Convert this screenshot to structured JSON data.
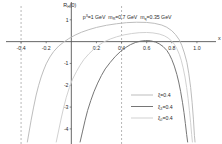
{
  "chart_data": {
    "type": "line",
    "title": "",
    "annotation": "p³=1 GeV   m_R=0.7 GeV   m_q=0.35 GeV",
    "annotation_parts": {
      "p_base": "p",
      "p_sup": "3",
      "p_val": "=1 GeV",
      "mR_base": "m",
      "mR_sub": "R",
      "mR_val": "=0.7 GeV",
      "mq_base": "m",
      "mq_sub": "q",
      "mq_val": "=0.35 GeV"
    },
    "ylabel": "R",
    "ylabel_sub": "H",
    "ylabel_tail": "(0)",
    "xlabel": "x",
    "xlim": [
      -0.52,
      1.12
    ],
    "ylim": [
      -4.6,
      1.45
    ],
    "xticks": [
      -0.4,
      -0.2,
      0.2,
      0.4,
      0.6,
      0.8,
      1.0
    ],
    "xticklabels": [
      "-0.4",
      "-0.2",
      "0.2",
      "0.4",
      "0.6",
      "0.8",
      "1.0"
    ],
    "yticks": [
      1,
      -1,
      -2,
      -3,
      -4
    ],
    "yticklabels": [
      "1",
      "-1",
      "-2",
      "-3",
      "-4"
    ],
    "grid": false,
    "vlines": [
      -0.4,
      0.4
    ],
    "vline_style": "dashed",
    "legend_position": "lower-right",
    "series": [
      {
        "name": "xi",
        "label": "ξ=0.4",
        "color": "#b9b9b9",
        "points": [
          [
            -0.35,
            -4.6
          ],
          [
            -0.32,
            -3.6
          ],
          [
            -0.3,
            -3.0
          ],
          [
            -0.28,
            -2.45
          ],
          [
            -0.26,
            -2.0
          ],
          [
            -0.24,
            -1.62
          ],
          [
            -0.22,
            -1.3
          ],
          [
            -0.2,
            -1.02
          ],
          [
            -0.17,
            -0.7
          ],
          [
            -0.14,
            -0.45
          ],
          [
            -0.1,
            -0.2
          ],
          [
            -0.06,
            -0.02
          ],
          [
            -0.02,
            0.14
          ],
          [
            0.03,
            0.3
          ],
          [
            0.08,
            0.43
          ],
          [
            0.14,
            0.55
          ],
          [
            0.2,
            0.65
          ],
          [
            0.28,
            0.75
          ],
          [
            0.36,
            0.82
          ],
          [
            0.44,
            0.87
          ],
          [
            0.52,
            0.89
          ],
          [
            0.6,
            0.88
          ],
          [
            0.66,
            0.84
          ],
          [
            0.72,
            0.76
          ],
          [
            0.76,
            0.66
          ],
          [
            0.8,
            0.5
          ],
          [
            0.83,
            0.32
          ],
          [
            0.86,
            0.08
          ],
          [
            0.88,
            -0.18
          ],
          [
            0.9,
            -0.52
          ],
          [
            0.92,
            -0.95
          ],
          [
            0.935,
            -1.45
          ],
          [
            0.95,
            -2.1
          ],
          [
            0.962,
            -2.8
          ],
          [
            0.972,
            -3.55
          ],
          [
            0.98,
            -4.3
          ],
          [
            0.985,
            -4.6
          ]
        ]
      },
      {
        "name": "xi3",
        "label": "ξ₃=0.4",
        "color": "#6f6f6f",
        "points": [
          [
            0.07,
            -4.6
          ],
          [
            0.09,
            -4.1
          ],
          [
            0.11,
            -3.6
          ],
          [
            0.13,
            -3.15
          ],
          [
            0.155,
            -2.7
          ],
          [
            0.18,
            -2.3
          ],
          [
            0.21,
            -1.9
          ],
          [
            0.24,
            -1.55
          ],
          [
            0.27,
            -1.25
          ],
          [
            0.31,
            -0.95
          ],
          [
            0.35,
            -0.68
          ],
          [
            0.39,
            -0.46
          ],
          [
            0.43,
            -0.28
          ],
          [
            0.47,
            -0.14
          ],
          [
            0.51,
            -0.04
          ],
          [
            0.55,
            0.02
          ],
          [
            0.59,
            0.05
          ],
          [
            0.63,
            0.04
          ],
          [
            0.67,
            -0.02
          ],
          [
            0.7,
            -0.1
          ],
          [
            0.73,
            -0.22
          ],
          [
            0.76,
            -0.4
          ],
          [
            0.78,
            -0.58
          ],
          [
            0.8,
            -0.82
          ],
          [
            0.82,
            -1.12
          ],
          [
            0.84,
            -1.5
          ],
          [
            0.855,
            -1.85
          ],
          [
            0.87,
            -2.28
          ],
          [
            0.885,
            -2.78
          ],
          [
            0.897,
            -3.25
          ],
          [
            0.908,
            -3.75
          ],
          [
            0.918,
            -4.25
          ],
          [
            0.926,
            -4.6
          ]
        ]
      },
      {
        "name": "xi0",
        "label": "ξ₀=0.4",
        "color": "#cfcfcf",
        "points": [
          [
            -0.12,
            -4.6
          ],
          [
            -0.1,
            -4.05
          ],
          [
            -0.08,
            -3.5
          ],
          [
            -0.06,
            -3.0
          ],
          [
            -0.04,
            -2.55
          ],
          [
            -0.015,
            -2.1
          ],
          [
            0.01,
            -1.72
          ],
          [
            0.04,
            -1.38
          ],
          [
            0.07,
            -1.08
          ],
          [
            0.1,
            -0.82
          ],
          [
            0.14,
            -0.56
          ],
          [
            0.18,
            -0.34
          ],
          [
            0.22,
            -0.16
          ],
          [
            0.26,
            -0.01
          ],
          [
            0.31,
            0.12
          ],
          [
            0.36,
            0.22
          ],
          [
            0.42,
            0.31
          ],
          [
            0.48,
            0.37
          ],
          [
            0.54,
            0.41
          ],
          [
            0.6,
            0.42
          ],
          [
            0.65,
            0.4
          ],
          [
            0.7,
            0.35
          ],
          [
            0.74,
            0.27
          ],
          [
            0.77,
            0.17
          ],
          [
            0.8,
            0.02
          ],
          [
            0.82,
            -0.12
          ],
          [
            0.84,
            -0.32
          ],
          [
            0.86,
            -0.58
          ],
          [
            0.875,
            -0.85
          ],
          [
            0.89,
            -1.2
          ],
          [
            0.905,
            -1.62
          ],
          [
            0.918,
            -2.1
          ],
          [
            0.93,
            -2.62
          ],
          [
            0.94,
            -3.15
          ],
          [
            0.95,
            -3.72
          ],
          [
            0.958,
            -4.25
          ],
          [
            0.964,
            -4.6
          ]
        ]
      }
    ]
  },
  "legend_entries": [
    {
      "label": "ξ=0.4",
      "color": "#b9b9b9"
    },
    {
      "label": "ξ₃=0.4",
      "color": "#6f6f6f"
    },
    {
      "label": "ξ₀=0.4",
      "color": "#cfcfcf"
    }
  ],
  "style": {
    "axis_color": "#555555",
    "vline_color": "#9a9a9a",
    "background": "#ffffff"
  }
}
